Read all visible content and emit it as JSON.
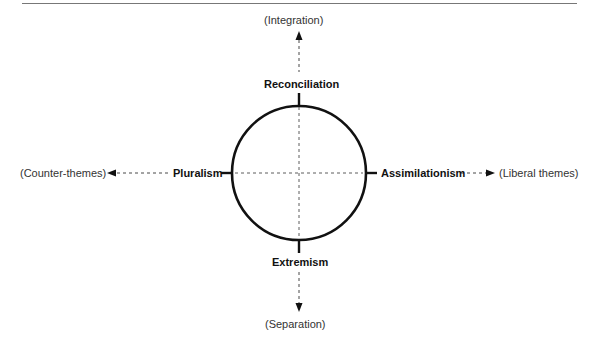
{
  "diagram": {
    "axes": {
      "top_pole": "(Integration)",
      "bottom_pole": "(Separation)",
      "left_pole": "(Counter-themes)",
      "right_pole": "(Liberal themes)"
    },
    "strategies": {
      "top": "Reconciliation",
      "bottom": "Extremism",
      "left": "Pluralism",
      "right": "Assimilationism"
    },
    "colors": {
      "line": "#111111",
      "rule": "#777777",
      "pole_text": "#333333"
    }
  }
}
